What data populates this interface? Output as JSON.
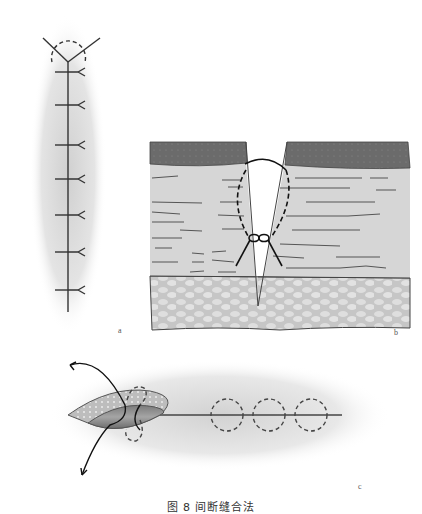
{
  "figure": {
    "caption": "图 8   间断缝合法",
    "panels": [
      {
        "id": "a",
        "label": "a",
        "description": "Suture line diagram with interrupted stitches along a vertical line"
      },
      {
        "id": "b",
        "label": "b",
        "description": "Cross-section of skin layers with a wedge incision and a dashed suture loop tied with a knot"
      },
      {
        "id": "c",
        "label": "c",
        "description": "Lens-shaped wound with a curved needle path and a row of dashed circular interrupted sutures"
      }
    ]
  },
  "colors": {
    "epidermis": "#6b6b6b",
    "dermis": "#d6d6d6",
    "subcutis": "#c9c9c9",
    "line": "#333333",
    "shadow": "#d8d8d8"
  }
}
